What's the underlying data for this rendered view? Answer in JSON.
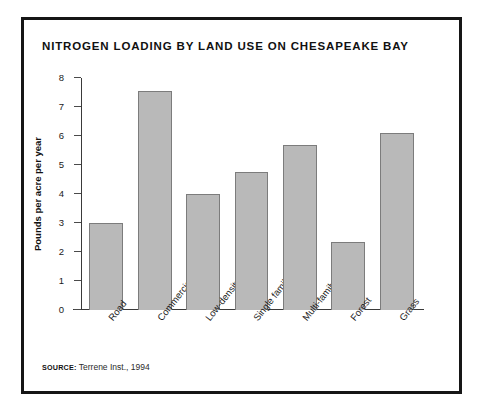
{
  "figure": {
    "title": "NITROGEN LOADING BY LAND USE ON CHESAPEAKE BAY",
    "source_label": "SOURCE:",
    "source_text": "Terrene Inst., 1994",
    "frame_color": "#161616",
    "bar_fill": "#b9b9b9",
    "bar_stroke": "#7c7c7c",
    "background": "#ffffff"
  },
  "chart_data": {
    "type": "bar",
    "title": "NITROGEN LOADING BY LAND USE ON CHESAPEAKE BAY",
    "xlabel": "",
    "ylabel": "Pounds per acre per year",
    "categories": [
      "Road",
      "Commercial",
      "Low-density",
      "Single family",
      "Multi-family",
      "Forest",
      "Grass"
    ],
    "values": [
      3.0,
      7.55,
      4.0,
      4.75,
      5.7,
      2.35,
      6.1
    ],
    "ylim": [
      0,
      8
    ],
    "yticks": [
      0,
      1,
      2,
      3,
      4,
      5,
      6,
      7,
      8
    ],
    "ytick_labels": [
      "0",
      "1",
      "2",
      "3",
      "4",
      "5",
      "6",
      "7",
      "8"
    ],
    "grid": false,
    "legend": null
  }
}
